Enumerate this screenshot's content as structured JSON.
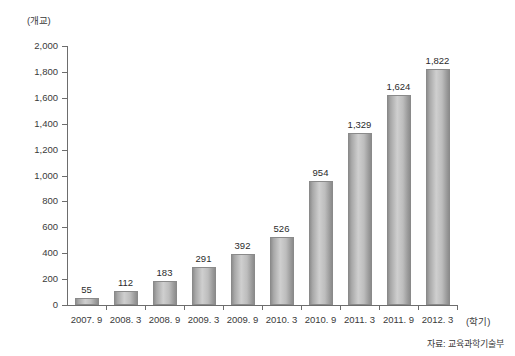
{
  "chart_data": {
    "type": "bar",
    "title": "",
    "subtitle": "",
    "xlabel": "(학기)",
    "ylabel": "(개교)",
    "categories": [
      "2007. 9",
      "2008. 3",
      "2008. 9",
      "2009. 3",
      "2009. 9",
      "2010. 3",
      "2010. 9",
      "2011. 3",
      "2011. 9",
      "2012. 3"
    ],
    "values": [
      55,
      112,
      183,
      291,
      392,
      526,
      954,
      1329,
      1624,
      1822
    ],
    "value_labels": [
      "55",
      "112",
      "183",
      "291",
      "392",
      "526",
      "954",
      "1,329",
      "1,624",
      "1,822"
    ],
    "ylim": [
      0,
      2000
    ],
    "ytick_values": [
      0,
      200,
      400,
      600,
      800,
      1000,
      1200,
      1400,
      1600,
      1800,
      2000
    ],
    "ytick_labels": [
      "0",
      "200",
      "400",
      "600",
      "800",
      "1,000",
      "1,200",
      "1,400",
      "1,600",
      "1,800",
      "2,000"
    ],
    "grid": false,
    "legend": null,
    "legend_position": "none",
    "series": [
      {
        "name": "",
        "values": [
          55,
          112,
          183,
          291,
          392,
          526,
          954,
          1329,
          1624,
          1822
        ]
      }
    ],
    "annotations": {
      "source": "자료: 교육과학기술부"
    },
    "colors": {
      "bar_light": "#cfcfcf",
      "bar_dark": "#8c8c8c",
      "bar_border": "#8a8a8a",
      "axis": "#6d6d6d",
      "text": "#2b2b2b",
      "background": "#ffffff"
    }
  }
}
